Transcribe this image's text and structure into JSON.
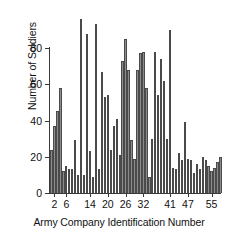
{
  "chart_data": {
    "type": "bar",
    "title": "",
    "xlabel": "Army Company Identification Number",
    "ylabel": "Number of Soldiers",
    "ylim": [
      0,
      96
    ],
    "yticks": [
      0,
      20,
      40,
      60,
      80
    ],
    "xticks": [
      2,
      6,
      14,
      20,
      26,
      32,
      41,
      47,
      55
    ],
    "grid": false,
    "legend": null,
    "bar_color": "#8c8c8c",
    "bar_border_color": "#4a4a4a",
    "axis_color": "#3a3a3a",
    "categories": [
      "1",
      "2",
      "3",
      "4",
      "5",
      "6",
      "7",
      "8",
      "9",
      "10",
      "11",
      "12",
      "13",
      "14",
      "15",
      "16",
      "17",
      "18",
      "19",
      "20",
      "21",
      "22",
      "23",
      "24",
      "25",
      "26",
      "27",
      "28",
      "29",
      "30",
      "31",
      "32",
      "33",
      "34",
      "35",
      "36",
      "37",
      "38",
      "39",
      "40",
      "41",
      "42",
      "43",
      "44",
      "45",
      "46",
      "47",
      "48",
      "49",
      "50",
      "51",
      "52",
      "53",
      "54",
      "55",
      "56",
      "57",
      "58"
    ],
    "values": [
      24,
      37,
      45,
      58,
      12,
      15,
      13,
      13,
      29,
      10,
      96,
      10,
      88,
      23,
      9,
      93,
      13,
      67,
      53,
      54,
      24,
      37,
      41,
      21,
      73,
      85,
      68,
      29,
      19,
      68,
      77,
      78,
      58,
      9,
      30,
      78,
      54,
      74,
      62,
      30,
      90,
      14,
      13,
      22,
      18,
      39,
      19,
      18,
      11,
      16,
      13,
      20,
      18,
      15,
      12,
      14,
      17,
      20
    ]
  }
}
